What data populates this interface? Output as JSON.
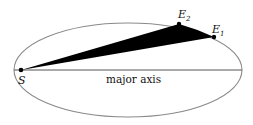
{
  "diagram": {
    "type": "kepler-ellipse-area-sweep",
    "ellipse": {
      "cx": 128,
      "cy": 70,
      "rx": 114,
      "ry": 47,
      "stroke": "#8a8a8a"
    },
    "axis": {
      "x1": 14,
      "x2": 242,
      "y": 70,
      "label": "major axis",
      "stroke": "#555555"
    },
    "points": {
      "S": {
        "label": "S",
        "x": 21,
        "y": 70
      },
      "E1": {
        "label": "E",
        "sub": "1",
        "x": 214,
        "y": 37
      },
      "E2": {
        "label": "E",
        "sub": "2",
        "x": 179,
        "y": 24
      }
    },
    "sector_fill": "#000000"
  }
}
